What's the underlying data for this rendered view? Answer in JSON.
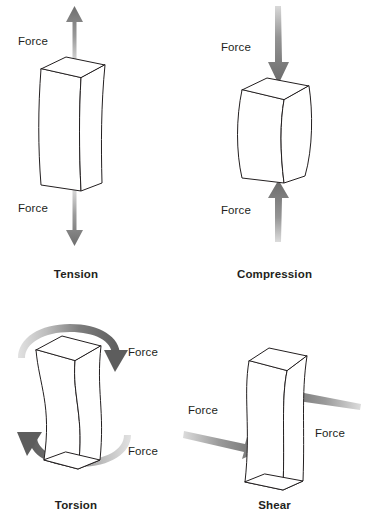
{
  "figure": {
    "background_color": "#ffffff",
    "line_color": "#231f20",
    "arrow_color_dark": "#6b6b6b",
    "arrow_color_light": "#c9c9c9",
    "text_color": "#231f20"
  },
  "panels": [
    {
      "id": "tension",
      "caption": "Tension",
      "force_labels": [
        {
          "text": "Force",
          "position": "top-left"
        },
        {
          "text": "Force",
          "position": "bottom-left"
        }
      ],
      "arrows": [
        {
          "name": "up-arrow",
          "direction": "up"
        },
        {
          "name": "down-arrow",
          "direction": "down"
        }
      ],
      "block": "stretched-prism"
    },
    {
      "id": "compression",
      "caption": "Compression",
      "force_labels": [
        {
          "text": "Force",
          "position": "top-left"
        },
        {
          "text": "Force",
          "position": "bottom-left"
        }
      ],
      "arrows": [
        {
          "name": "down-arrow",
          "direction": "down"
        },
        {
          "name": "up-arrow",
          "direction": "up"
        }
      ],
      "block": "squashed-prism"
    },
    {
      "id": "torsion",
      "caption": "Torsion",
      "force_labels": [
        {
          "text": "Force",
          "position": "upper-right"
        },
        {
          "text": "Force",
          "position": "lower-right"
        }
      ],
      "arrows": [
        {
          "name": "curved-arrow-clockwise",
          "direction": "clockwise-top"
        },
        {
          "name": "curved-arrow-counterclockwise",
          "direction": "counterclockwise-bottom"
        }
      ],
      "block": "twisted-prism"
    },
    {
      "id": "shear",
      "caption": "Shear",
      "force_labels": [
        {
          "text": "Force",
          "position": "left"
        },
        {
          "text": "Force",
          "position": "right"
        }
      ],
      "arrows": [
        {
          "name": "right-arrow",
          "direction": "right"
        },
        {
          "name": "left-arrow",
          "direction": "left"
        }
      ],
      "block": "sheared-prism"
    }
  ]
}
